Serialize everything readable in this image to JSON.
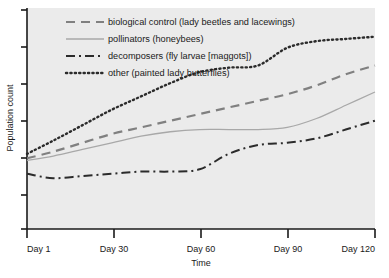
{
  "chart_data": {
    "type": "line",
    "title": "",
    "xlabel": "Time",
    "ylabel": "Population count",
    "xtick_labels": [
      "Day 1",
      "Day 30",
      "Day 60",
      "Day 90",
      "Day 120"
    ],
    "xtick_values": [
      1,
      30,
      60,
      90,
      120
    ],
    "ytick_labels": [
      "",
      "",
      "",
      "",
      "",
      "",
      ""
    ],
    "xlim": [
      1,
      120
    ],
    "ylim": [
      0,
      100
    ],
    "grid": false,
    "legend_position": "top-left-inside",
    "plot_background": "#ebebeb",
    "series": [
      {
        "name": "biological control (lady beetles and lacewings)",
        "style": "dashed",
        "color": "#808080",
        "width": 2.2,
        "x": [
          1,
          10,
          20,
          30,
          40,
          50,
          60,
          70,
          80,
          90,
          100,
          110,
          120
        ],
        "values": [
          32,
          35,
          39,
          43,
          46,
          49,
          52,
          55,
          58,
          61,
          65,
          70,
          74
        ]
      },
      {
        "name": "pollinators (honeybees)",
        "style": "solid",
        "color": "#a8a8a8",
        "width": 1.3,
        "x": [
          1,
          10,
          20,
          30,
          40,
          50,
          60,
          70,
          80,
          90,
          100,
          110,
          120
        ],
        "values": [
          31,
          33,
          36,
          39,
          42,
          44,
          45,
          45,
          45,
          46,
          50,
          56,
          62
        ]
      },
      {
        "name": "decomposers (fly larvae [maggots])",
        "style": "dashdot",
        "color": "#2b2b2b",
        "width": 2.0,
        "x": [
          1,
          10,
          20,
          30,
          40,
          50,
          60,
          70,
          80,
          90,
          100,
          110,
          120
        ],
        "values": [
          25,
          23,
          24,
          25,
          26,
          26,
          27,
          34,
          38,
          39,
          41,
          45,
          49
        ]
      },
      {
        "name": "other (painted lady butterflies)",
        "style": "dotted",
        "color": "#2b2b2b",
        "width": 2.4,
        "x": [
          1,
          10,
          20,
          30,
          40,
          50,
          60,
          70,
          80,
          90,
          100,
          110,
          120
        ],
        "values": [
          34,
          40,
          47,
          54,
          60,
          66,
          71,
          73,
          74,
          82,
          85,
          86,
          87
        ]
      }
    ],
    "legend_entries": [
      {
        "label": "biological control (lady beetles and lacewings)",
        "style": "dashed",
        "color": "#808080"
      },
      {
        "label": "pollinators (honeybees)",
        "style": "solid",
        "color": "#a8a8a8"
      },
      {
        "label": "decomposers (fly larvae [maggots])",
        "style": "dashdot",
        "color": "#2b2b2b"
      },
      {
        "label": "other (painted lady butterflies)",
        "style": "dotted",
        "color": "#2b2b2b"
      }
    ]
  }
}
